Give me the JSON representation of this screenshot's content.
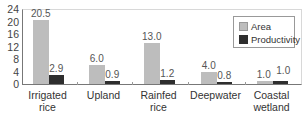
{
  "chart_data": {
    "type": "bar",
    "title": "",
    "xlabel": "",
    "ylabel": "",
    "ylim": [
      0,
      24
    ],
    "yticks": [
      "0",
      "4",
      "8",
      "12",
      "16",
      "20",
      "24"
    ],
    "categories": [
      "Irrigated rice",
      "Upland",
      "Rainfed rice",
      "Deepwater",
      "Coastal wetland"
    ],
    "category_lines": [
      [
        "Irrigated",
        "rice"
      ],
      [
        "Upland",
        ""
      ],
      [
        "Rainfed",
        "rice"
      ],
      [
        "Deepwater",
        ""
      ],
      [
        "Coastal",
        "wetland"
      ]
    ],
    "series": [
      {
        "name": "Area",
        "color": "#bdbdbd",
        "values": [
          20.5,
          6.0,
          13.0,
          4.0,
          1.0
        ],
        "labels": [
          "20.5",
          "6.0",
          "13.0",
          "4.0",
          "1.0"
        ]
      },
      {
        "name": "Productivity",
        "color": "#2e2e2e",
        "values": [
          2.9,
          0.9,
          1.2,
          0.8,
          1.0
        ],
        "labels": [
          "2.9",
          "0.9",
          "1.2",
          "0.8",
          "1.0"
        ]
      }
    ],
    "grid": false,
    "legend_position": "upper right"
  },
  "legend": {
    "area": "Area",
    "productivity": "Productivity"
  }
}
